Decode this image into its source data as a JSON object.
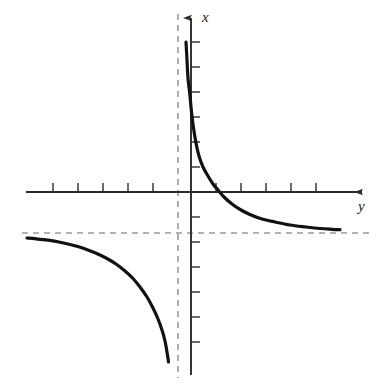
{
  "figure": {
    "title": "",
    "background_color": "#ffffff",
    "width": 382,
    "height": 388
  },
  "axes": {
    "vertical": {
      "label": "x",
      "name": "vertical-axis",
      "origin_px": 191,
      "top_px": 18,
      "bottom_px": 375,
      "color": "#2b2b2b",
      "arrow": "up",
      "tick_side": "right",
      "tick_length_px": 9,
      "tick_spacing_px": 25,
      "ticks_px": [
        42,
        67,
        92,
        117,
        142,
        167,
        217,
        242,
        267,
        292,
        317,
        342
      ]
    },
    "horizontal": {
      "label": "y",
      "name": "horizontal-axis",
      "origin_px": 192,
      "left_px": 26,
      "right_px": 362,
      "color": "#2b2b2b",
      "arrow": "right",
      "tick_side": "up",
      "tick_length_px": 9,
      "tick_spacing_px": 25,
      "ticks_px": [
        53,
        78,
        103,
        128,
        153,
        216,
        241,
        266,
        291,
        316
      ]
    }
  },
  "asymptotes": {
    "vertical": {
      "name": "vertical-asymptote",
      "position_px": 178,
      "from_px": 14,
      "to_px": 378,
      "color": "#9a9a9a",
      "dash": "6 5",
      "style": "dashed"
    },
    "horizontal": {
      "name": "horizontal-asymptote",
      "position_px": 233,
      "from_px": 22,
      "to_px": 372,
      "color": "#9a9a9a",
      "dash": "6 5",
      "style": "dashed"
    }
  },
  "chart_data": {
    "type": "line",
    "title": "",
    "xlabel": "y",
    "ylabel": "x",
    "grid": false,
    "legend": null,
    "curve_color": "#111111",
    "curve_width_px": 3.2,
    "asymptote_values": {
      "vertical_x": -0.52,
      "horizontal_y": -1.64
    },
    "axis_crossing_px": {
      "x": 218,
      "y": 192
    },
    "series": [
      {
        "name": "upper-right-branch",
        "points_px": [
          [
            186,
            42
          ],
          [
            187,
            60
          ],
          [
            188,
            78
          ],
          [
            190,
            96
          ],
          [
            191.5,
            112
          ],
          [
            193.5,
            128
          ],
          [
            196,
            143
          ],
          [
            199,
            156
          ],
          [
            203,
            167
          ],
          [
            208,
            176
          ],
          [
            213,
            184
          ],
          [
            218,
            190
          ],
          [
            224,
            197
          ],
          [
            232,
            204
          ],
          [
            241,
            210
          ],
          [
            251,
            215
          ],
          [
            262,
            219
          ],
          [
            275,
            222
          ],
          [
            290,
            225
          ],
          [
            306,
            227
          ],
          [
            320,
            228.5
          ],
          [
            332,
            229.3
          ],
          [
            340,
            229.7
          ]
        ]
      },
      {
        "name": "lower-left-branch",
        "points_px": [
          [
            27,
            238
          ],
          [
            36,
            238.8
          ],
          [
            48,
            240.2
          ],
          [
            60,
            242.2
          ],
          [
            72,
            245
          ],
          [
            84,
            248.5
          ],
          [
            95,
            252.8
          ],
          [
            106,
            258
          ],
          [
            116,
            264
          ],
          [
            125,
            271
          ],
          [
            133,
            278.5
          ],
          [
            140,
            287
          ],
          [
            147,
            297
          ],
          [
            153,
            308
          ],
          [
            158,
            319
          ],
          [
            162,
            330
          ],
          [
            165,
            341
          ],
          [
            167,
            352
          ],
          [
            168.5,
            362
          ]
        ]
      }
    ]
  },
  "labels": {
    "vertical_axis_label": "x",
    "horizontal_axis_label": "y"
  }
}
